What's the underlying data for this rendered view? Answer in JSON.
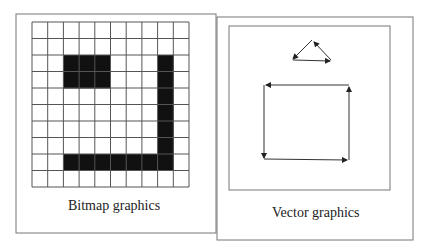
{
  "panels": [
    {
      "caption": "Bitmap graphics"
    },
    {
      "caption": "Vector graphics"
    }
  ],
  "bitmap": {
    "rows": 10,
    "cols": 10,
    "filled": [
      [
        2,
        2
      ],
      [
        2,
        3
      ],
      [
        2,
        4
      ],
      [
        3,
        2
      ],
      [
        3,
        3
      ],
      [
        3,
        4
      ],
      [
        2,
        8
      ],
      [
        3,
        8
      ],
      [
        4,
        8
      ],
      [
        5,
        8
      ],
      [
        6,
        8
      ],
      [
        7,
        8
      ],
      [
        8,
        8
      ],
      [
        8,
        2
      ],
      [
        8,
        3
      ],
      [
        8,
        4
      ],
      [
        8,
        5
      ],
      [
        8,
        6
      ],
      [
        8,
        7
      ]
    ]
  },
  "colors": {
    "line": "#555555",
    "fill": "#111111"
  }
}
